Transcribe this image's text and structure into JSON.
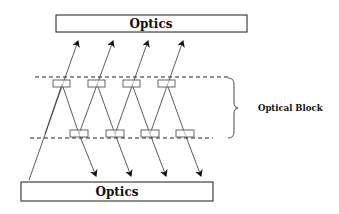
{
  "diagram": {
    "top_box": {
      "label": "Optics"
    },
    "bottom_box": {
      "label": "Optics"
    },
    "brace_label": "Optical Block",
    "top_elements_count": 4,
    "bottom_elements_count": 4,
    "colors": {
      "stroke": "#1a1a1a",
      "element_stroke": "#555555",
      "background": "#ffffff"
    }
  }
}
